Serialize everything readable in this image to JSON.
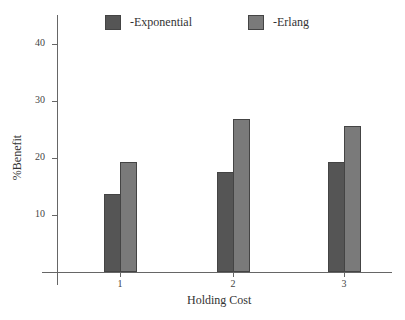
{
  "chart_data": {
    "type": "bar",
    "title": "",
    "xlabel": "Holding Cost",
    "ylabel": "%Benefit",
    "categories": [
      "1",
      "2",
      "3"
    ],
    "series": [
      {
        "name": "-Exponential",
        "color": "#555555",
        "values": [
          13.7,
          17.5,
          19.3
        ]
      },
      {
        "name": "-Erlang",
        "color": "#7a7a7a",
        "values": [
          19.3,
          26.8,
          25.6
        ]
      }
    ],
    "yticks": [
      10,
      20,
      30,
      40
    ],
    "ylim": [
      0,
      45
    ],
    "grid": false,
    "legend_position": "top"
  }
}
